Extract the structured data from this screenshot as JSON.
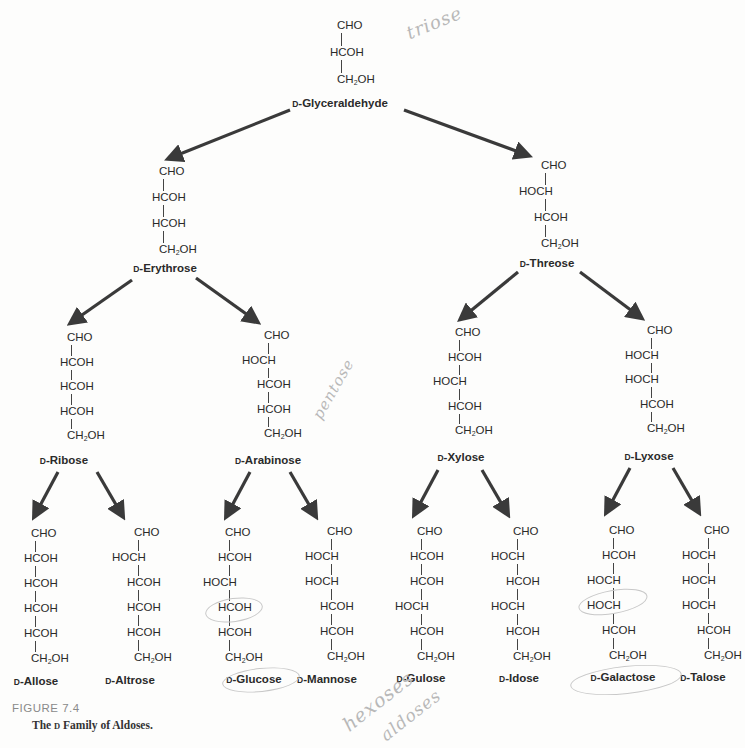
{
  "figure": {
    "label": "FIGURE 7.4",
    "title_prefix": "The ",
    "title_d": "D",
    "title_suffix": " Family of Aldoses."
  },
  "colors": {
    "arrow": "#3a3a3a",
    "text": "#2a2a2a",
    "handwriting": "#b8b8b8"
  },
  "molecules": [
    {
      "id": "glyceraldehyde",
      "name_prefix": "D",
      "name": "-Glyceraldehyde",
      "carbons": 3,
      "chain": [
        "CHO",
        "HCOH",
        "CH2OH"
      ]
    },
    {
      "id": "erythrose",
      "name_prefix": "D",
      "name": "-Erythrose",
      "carbons": 4,
      "chain": [
        "CHO",
        "HCOH",
        "HCOH",
        "CH2OH"
      ]
    },
    {
      "id": "threose",
      "name_prefix": "D",
      "name": "-Threose",
      "carbons": 4,
      "chain": [
        "CHO",
        "HOCH",
        "HCOH",
        "CH2OH"
      ]
    },
    {
      "id": "ribose",
      "name_prefix": "D",
      "name": "-Ribose",
      "carbons": 5,
      "chain": [
        "CHO",
        "HCOH",
        "HCOH",
        "HCOH",
        "CH2OH"
      ]
    },
    {
      "id": "arabinose",
      "name_prefix": "D",
      "name": "-Arabinose",
      "carbons": 5,
      "chain": [
        "CHO",
        "HOCH",
        "HCOH",
        "HCOH",
        "CH2OH"
      ]
    },
    {
      "id": "xylose",
      "name_prefix": "D",
      "name": "-Xylose",
      "carbons": 5,
      "chain": [
        "CHO",
        "HCOH",
        "HOCH",
        "HCOH",
        "CH2OH"
      ]
    },
    {
      "id": "lyxose",
      "name_prefix": "D",
      "name": "-Lyxose",
      "carbons": 5,
      "chain": [
        "CHO",
        "HOCH",
        "HOCH",
        "HCOH",
        "CH2OH"
      ]
    },
    {
      "id": "allose",
      "name_prefix": "D",
      "name": "-Allose",
      "carbons": 6,
      "chain": [
        "CHO",
        "HCOH",
        "HCOH",
        "HCOH",
        "HCOH",
        "CH2OH"
      ]
    },
    {
      "id": "altrose",
      "name_prefix": "D",
      "name": "-Altrose",
      "carbons": 6,
      "chain": [
        "CHO",
        "HOCH",
        "HCOH",
        "HCOH",
        "HCOH",
        "CH2OH"
      ]
    },
    {
      "id": "glucose",
      "name_prefix": "D",
      "name": "-Glucose",
      "carbons": 6,
      "chain": [
        "CHO",
        "HCOH",
        "HOCH",
        "HCOH",
        "HCOH",
        "CH2OH"
      ]
    },
    {
      "id": "mannose",
      "name_prefix": "D",
      "name": "-Mannose",
      "carbons": 6,
      "chain": [
        "CHO",
        "HOCH",
        "HOCH",
        "HCOH",
        "HCOH",
        "CH2OH"
      ]
    },
    {
      "id": "gulose",
      "name_prefix": "D",
      "name": "-Gulose",
      "carbons": 6,
      "chain": [
        "CHO",
        "HCOH",
        "HCOH",
        "HOCH",
        "HCOH",
        "CH2OH"
      ]
    },
    {
      "id": "idose",
      "name_prefix": "D",
      "name": "-Idose",
      "carbons": 6,
      "chain": [
        "CHO",
        "HOCH",
        "HCOH",
        "HOCH",
        "HCOH",
        "CH2OH"
      ]
    },
    {
      "id": "galactose",
      "name_prefix": "D",
      "name": "-Galactose",
      "carbons": 6,
      "chain": [
        "CHO",
        "HCOH",
        "HOCH",
        "HOCH",
        "HCOH",
        "CH2OH"
      ]
    },
    {
      "id": "talose",
      "name_prefix": "D",
      "name": "-Talose",
      "carbons": 6,
      "chain": [
        "CHO",
        "HOCH",
        "HOCH",
        "HOCH",
        "HCOH",
        "CH2OH"
      ]
    }
  ],
  "edges": [
    [
      "glyceraldehyde",
      "erythrose"
    ],
    [
      "glyceraldehyde",
      "threose"
    ],
    [
      "erythrose",
      "ribose"
    ],
    [
      "erythrose",
      "arabinose"
    ],
    [
      "threose",
      "xylose"
    ],
    [
      "threose",
      "lyxose"
    ],
    [
      "ribose",
      "allose"
    ],
    [
      "ribose",
      "altrose"
    ],
    [
      "arabinose",
      "glucose"
    ],
    [
      "arabinose",
      "mannose"
    ],
    [
      "xylose",
      "gulose"
    ],
    [
      "xylose",
      "idose"
    ],
    [
      "lyxose",
      "galactose"
    ],
    [
      "lyxose",
      "talose"
    ]
  ],
  "handwritten_notes": [
    {
      "text": "triose",
      "near": "glyceraldehyde"
    },
    {
      "text": "pentose",
      "near": "arabinose"
    },
    {
      "text": "hexoses",
      "near": "bottom"
    },
    {
      "text": "aldoses",
      "near": "bottom"
    }
  ]
}
